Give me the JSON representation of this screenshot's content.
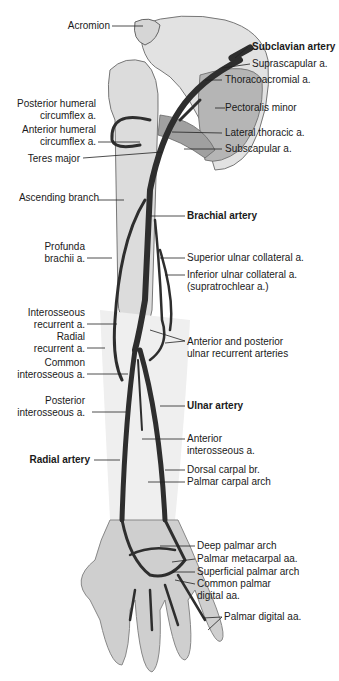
{
  "figure": {
    "left_labels": [
      {
        "id": "acromion",
        "lines": [
          "Acromion"
        ],
        "bold": false
      },
      {
        "id": "posterior-humeral-circumflex",
        "lines": [
          "Posterior humeral",
          "circumflex a."
        ],
        "bold": false
      },
      {
        "id": "anterior-humeral-circumflex",
        "lines": [
          "Anterior humeral",
          "circumflex a."
        ],
        "bold": false
      },
      {
        "id": "teres-major",
        "lines": [
          "Teres major"
        ],
        "bold": false
      },
      {
        "id": "ascending-branch",
        "lines": [
          "Ascending branch"
        ],
        "bold": false
      },
      {
        "id": "profunda-brachii",
        "lines": [
          "Profunda",
          "brachii a."
        ],
        "bold": false
      },
      {
        "id": "interosseous-recurrent",
        "lines": [
          "Interosseous",
          "recurrent a."
        ],
        "bold": false
      },
      {
        "id": "radial-recurrent",
        "lines": [
          "Radial",
          "recurrent a."
        ],
        "bold": false
      },
      {
        "id": "common-interosseous",
        "lines": [
          "Common",
          "interosseous a."
        ],
        "bold": false
      },
      {
        "id": "posterior-interosseous",
        "lines": [
          "Posterior",
          "interosseous a."
        ],
        "bold": false
      },
      {
        "id": "radial-artery",
        "lines": [
          "Radial artery"
        ],
        "bold": true
      }
    ],
    "right_labels": [
      {
        "id": "subclavian-artery",
        "lines": [
          "Subclavian artery"
        ],
        "bold": true
      },
      {
        "id": "suprascapular",
        "lines": [
          "Suprascapular a."
        ],
        "bold": false
      },
      {
        "id": "thoracoacromial",
        "lines": [
          "Thoracoacromial a."
        ],
        "bold": false
      },
      {
        "id": "pectoralis-minor",
        "lines": [
          "Pectoralis minor"
        ],
        "bold": false
      },
      {
        "id": "lateral-thoracic",
        "lines": [
          "Lateral thoracic a."
        ],
        "bold": false
      },
      {
        "id": "subscapular",
        "lines": [
          "Subscapular a."
        ],
        "bold": false
      },
      {
        "id": "brachial-artery",
        "lines": [
          "Brachial artery"
        ],
        "bold": true
      },
      {
        "id": "superior-ulnar-collateral",
        "lines": [
          "Superior ulnar collateral a."
        ],
        "bold": false
      },
      {
        "id": "inferior-ulnar-collateral",
        "lines": [
          "Inferior ulnar collateral a.",
          "(supratrochlear a.)"
        ],
        "bold": false
      },
      {
        "id": "ulnar-recurrent",
        "lines": [
          "Anterior and posterior",
          "ulnar recurrent arteries"
        ],
        "bold": false
      },
      {
        "id": "ulnar-artery",
        "lines": [
          "Ulnar artery"
        ],
        "bold": true
      },
      {
        "id": "anterior-interosseous",
        "lines": [
          "Anterior",
          "interosseous a."
        ],
        "bold": false
      },
      {
        "id": "dorsal-carpal",
        "lines": [
          "Dorsal carpal br."
        ],
        "bold": false
      },
      {
        "id": "palmar-carpal-arch",
        "lines": [
          "Palmar carpal arch"
        ],
        "bold": false
      },
      {
        "id": "deep-palmar-arch",
        "lines": [
          "Deep palmar arch"
        ],
        "bold": false
      },
      {
        "id": "palmar-metacarpal",
        "lines": [
          "Palmar metacarpal aa."
        ],
        "bold": false
      },
      {
        "id": "superficial-palmar-arch",
        "lines": [
          "Superficial palmar arch"
        ],
        "bold": false
      },
      {
        "id": "common-palmar-digital",
        "lines": [
          "Common palmar",
          "digital aa."
        ],
        "bold": false
      },
      {
        "id": "palmar-digital",
        "lines": [
          "Palmar digital aa."
        ],
        "bold": false
      }
    ],
    "colors": {
      "artery": "#2e2e2e",
      "bone": "#d9d9d9",
      "skin": "#c8c8c8",
      "muscle": "#9a9a9a",
      "leader": "#222222"
    }
  }
}
